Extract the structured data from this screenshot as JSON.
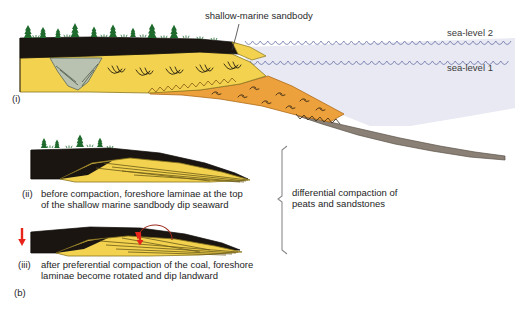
{
  "figure": {
    "panel_i_label": "(i)",
    "panel_ii_label": "(ii)",
    "panel_iii_label": "(iii)",
    "figure_label": "(b)"
  },
  "annotations": {
    "sandbody": "shallow-marine sandbody",
    "sea_level_2": "sea-level 2",
    "sea_level_1": "sea-level 1",
    "bracket_line1": "differential compaction of",
    "bracket_line2": "peats and sandstones"
  },
  "captions": {
    "ii_line1": "before compaction, foreshore laminae at the top",
    "ii_line2": "of the shallow marine sandbody dip seaward",
    "iii_line1": "after preferential compaction of the coal, foreshore",
    "iii_line2": "laminae become rotated and dip landward"
  },
  "colors": {
    "coal": "#1a1510",
    "sand_yellow": "#f2d24f",
    "sand_yellow_light": "#f6e08a",
    "foreshore_orange": "#eda13c",
    "channel_fill": "#b9c2b0",
    "offshore_mud": "#8a8075",
    "sea_water": "#e8e9f2",
    "wave_line": "#6b74a8",
    "tree_green": "#1f6b2e",
    "arrow_red": "#e8231a",
    "rotation_arc": "#9b2b1e",
    "outline": "#1a1510",
    "bracket": "#8a8a8a",
    "text": "#242424"
  }
}
